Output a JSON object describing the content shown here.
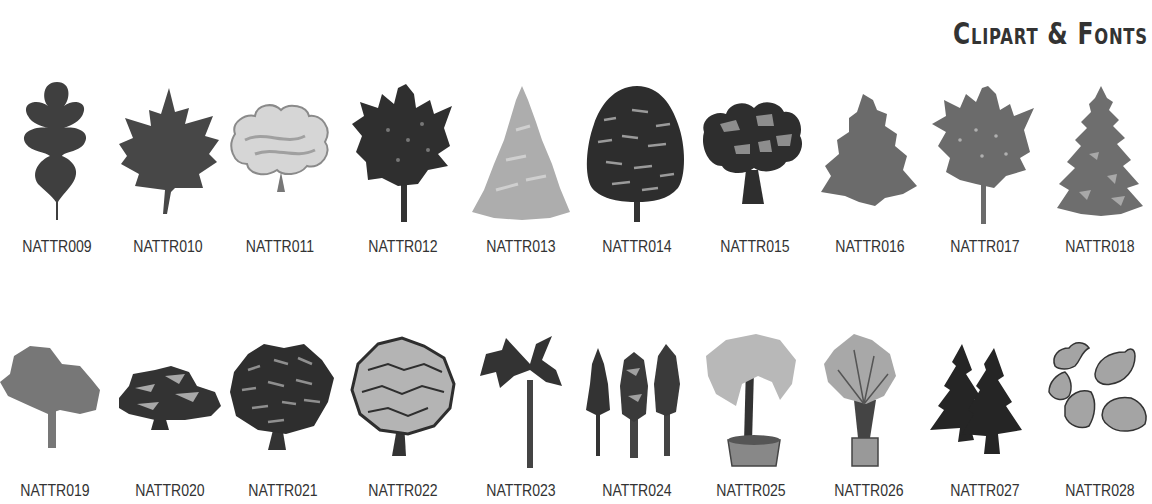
{
  "header": {
    "title": "Clipart & Fonts"
  },
  "colors": {
    "dark": "#3a3a3a",
    "mid": "#6e6e6e",
    "light": "#a9a9a9",
    "pale": "#d0d0d0",
    "text": "#333333"
  },
  "rows": [
    {
      "items": [
        {
          "code": "NATTR009",
          "icon": "oak-leaf-icon"
        },
        {
          "code": "NATTR010",
          "icon": "maple-leaf-icon"
        },
        {
          "code": "NATTR011",
          "icon": "light-deciduous-tree-icon"
        },
        {
          "code": "NATTR012",
          "icon": "dark-deciduous-tree-icon"
        },
        {
          "code": "NATTR013",
          "icon": "light-conifer-tree-icon"
        },
        {
          "code": "NATTR014",
          "icon": "dense-oval-tree-icon"
        },
        {
          "code": "NATTR015",
          "icon": "spreading-oak-tree-icon"
        },
        {
          "code": "NATTR016",
          "icon": "fir-tree-silhouette-icon"
        },
        {
          "code": "NATTR017",
          "icon": "grey-deciduous-tree-icon"
        },
        {
          "code": "NATTR018",
          "icon": "spruce-tree-icon"
        }
      ]
    },
    {
      "items": [
        {
          "code": "NATTR019",
          "icon": "broad-shade-tree-icon"
        },
        {
          "code": "NATTR020",
          "icon": "wide-cedar-tree-icon"
        },
        {
          "code": "NATTR021",
          "icon": "round-bushy-tree-icon"
        },
        {
          "code": "NATTR022",
          "icon": "round-outlined-tree-icon"
        },
        {
          "code": "NATTR023",
          "icon": "palm-tree-icon"
        },
        {
          "code": "NATTR024",
          "icon": "redwood-trees-icon"
        },
        {
          "code": "NATTR025",
          "icon": "potted-tree-icon"
        },
        {
          "code": "NATTR026",
          "icon": "potted-palm-plant-icon"
        },
        {
          "code": "NATTR027",
          "icon": "two-pine-trees-icon"
        },
        {
          "code": "NATTR028",
          "icon": "scattered-leaves-icon"
        }
      ]
    }
  ]
}
